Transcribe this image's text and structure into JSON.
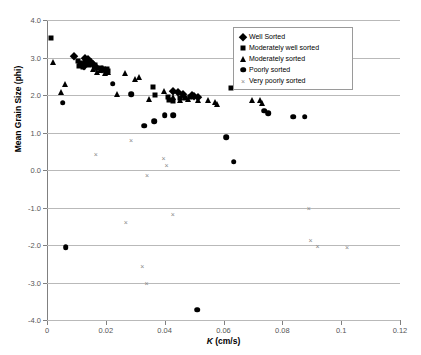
{
  "chart_data": {
    "type": "scatter",
    "title": "",
    "xlabel": "K (cm/s)",
    "ylabel": "Mean Grain Size (phi)",
    "xlim": [
      0,
      0.12
    ],
    "ylim": [
      -4.0,
      4.0
    ],
    "xticks": [
      "0",
      "0.02",
      "0.04",
      "0.06",
      "0.08",
      "0.1",
      "0.12"
    ],
    "xtick_values": [
      0,
      0.02,
      0.04,
      0.06,
      0.08,
      0.1,
      0.12
    ],
    "yticks": [
      "4.0",
      "3.0",
      "2.0",
      "1.0",
      "0.0",
      "-1.0",
      "-2.0",
      "-3.0",
      "-4.0"
    ],
    "ytick_values": [
      4.0,
      3.0,
      2.0,
      1.0,
      0.0,
      -1.0,
      -2.0,
      -3.0,
      -4.0
    ],
    "grid": "horizontal",
    "legend_position": "upper-right",
    "series": [
      {
        "name": "Well Sorted",
        "marker": "diamond",
        "color": "#000000",
        "points": [
          [
            0.0092,
            3.03
          ],
          [
            0.0128,
            2.98
          ],
          [
            0.0132,
            2.92
          ],
          [
            0.014,
            2.95
          ],
          [
            0.015,
            2.88
          ],
          [
            0.0158,
            2.83
          ],
          [
            0.0126,
            2.78
          ],
          [
            0.0168,
            2.76
          ],
          [
            0.0186,
            2.7
          ],
          [
            0.0196,
            2.66
          ],
          [
            0.043,
            2.12
          ],
          [
            0.0444,
            2.08
          ],
          [
            0.0462,
            2.03
          ],
          [
            0.0492,
            1.99
          ],
          [
            0.05,
            1.97
          ],
          [
            0.0512,
            1.96
          ]
        ]
      },
      {
        "name": "Moderately well sorted",
        "marker": "square",
        "color": "#000000",
        "points": [
          [
            0.0012,
            3.52
          ],
          [
            0.0106,
            2.92
          ],
          [
            0.0112,
            2.86
          ],
          [
            0.0118,
            2.82
          ],
          [
            0.0108,
            2.78
          ],
          [
            0.0124,
            2.74
          ],
          [
            0.0144,
            2.8
          ],
          [
            0.0162,
            2.79
          ],
          [
            0.0176,
            2.73
          ],
          [
            0.0204,
            2.7
          ],
          [
            0.0208,
            2.63
          ],
          [
            0.036,
            2.22
          ],
          [
            0.0368,
            2.0
          ],
          [
            0.041,
            1.96
          ],
          [
            0.0416,
            1.88
          ],
          [
            0.043,
            1.84
          ],
          [
            0.0452,
            1.93
          ],
          [
            0.047,
            1.92
          ],
          [
            0.0486,
            1.95
          ],
          [
            0.0626,
            2.18
          ]
        ]
      },
      {
        "name": "Moderately sorted",
        "marker": "triangle",
        "color": "#000000",
        "points": [
          [
            0.0022,
            2.88
          ],
          [
            0.006,
            2.3
          ],
          [
            0.0046,
            2.08
          ],
          [
            0.0136,
            2.86
          ],
          [
            0.0158,
            2.7
          ],
          [
            0.017,
            2.62
          ],
          [
            0.018,
            2.66
          ],
          [
            0.0192,
            2.72
          ],
          [
            0.0196,
            2.58
          ],
          [
            0.0206,
            2.62
          ],
          [
            0.0238,
            2.04
          ],
          [
            0.0266,
            2.58
          ],
          [
            0.03,
            2.44
          ],
          [
            0.0312,
            2.48
          ],
          [
            0.0346,
            1.9
          ],
          [
            0.0398,
            2.1
          ],
          [
            0.043,
            1.94
          ],
          [
            0.0452,
            1.88
          ],
          [
            0.047,
            1.96
          ],
          [
            0.0478,
            1.9
          ],
          [
            0.0512,
            1.86
          ],
          [
            0.0548,
            1.86
          ],
          [
            0.057,
            1.82
          ],
          [
            0.0578,
            1.76
          ],
          [
            0.0696,
            1.86
          ],
          [
            0.0724,
            1.88
          ],
          [
            0.073,
            1.78
          ]
        ]
      },
      {
        "name": "Poorly sorted",
        "marker": "circle",
        "color": "#000000",
        "points": [
          [
            0.0054,
            1.8
          ],
          [
            0.0224,
            2.3
          ],
          [
            0.0286,
            2.02
          ],
          [
            0.033,
            1.18
          ],
          [
            0.0364,
            1.3
          ],
          [
            0.04,
            1.46
          ],
          [
            0.043,
            1.46
          ],
          [
            0.0738,
            1.58
          ],
          [
            0.0752,
            1.52
          ],
          [
            0.0836,
            1.42
          ],
          [
            0.0876,
            1.42
          ],
          [
            0.061,
            0.88
          ],
          [
            0.0634,
            0.22
          ],
          [
            0.0064,
            -2.06
          ],
          [
            0.051,
            -3.72
          ]
        ]
      },
      {
        "name": "Very poorly sorted",
        "marker": "cross",
        "color": "#8a8a8a",
        "points": [
          [
            0.0166,
            0.42
          ],
          [
            0.0286,
            0.8
          ],
          [
            0.0396,
            0.32
          ],
          [
            0.0406,
            0.14
          ],
          [
            0.034,
            -0.14
          ],
          [
            0.0268,
            -1.38
          ],
          [
            0.0428,
            -1.18
          ],
          [
            0.089,
            -1.02
          ],
          [
            0.0896,
            -1.86
          ],
          [
            0.0324,
            -2.56
          ],
          [
            0.092,
            -2.02
          ],
          [
            0.102,
            -2.06
          ],
          [
            0.0338,
            -3.02
          ]
        ]
      }
    ]
  }
}
